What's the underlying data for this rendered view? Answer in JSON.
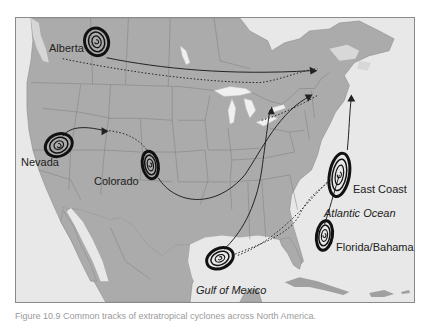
{
  "map": {
    "title": "Storm tracks of extratropical cyclones across North America",
    "colors": {
      "land": "#a9a9a9",
      "water": "#e6e6e6",
      "lakes": "#f2f2f2",
      "borders": "#7c7c7c",
      "tracks": "#222222",
      "frame": "#8a8a8a"
    },
    "labels": {
      "alberta": "Alberta",
      "nevada": "Nevada",
      "colorado": "Colorado",
      "east_coast": "East Coast",
      "atlantic": "Atlantic Ocean",
      "florida": "Florida/Bahamas",
      "gulf": "Gulf of Mexico"
    },
    "storm_origins": [
      {
        "name": "Alberta",
        "x": 96,
        "y": 41
      },
      {
        "name": "Nevada",
        "x": 60,
        "y": 145
      },
      {
        "name": "Colorado",
        "x": 150,
        "y": 165
      },
      {
        "name": "East Coast",
        "x": 340,
        "y": 175
      },
      {
        "name": "Florida/Bahamas",
        "x": 325,
        "y": 232
      },
      {
        "name": "Gulf of Mexico",
        "x": 222,
        "y": 259
      }
    ],
    "legend": {
      "solid_line": "Common storm track",
      "dotted_line": "Alternate storm track"
    }
  },
  "caption": {
    "text": "Figure 10.9  Common tracks of extratropical cyclones across North America."
  }
}
